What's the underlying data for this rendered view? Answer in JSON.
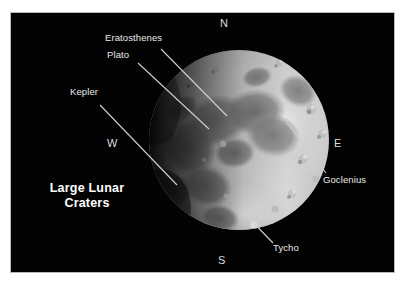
{
  "figure": {
    "title_line1": "Large Lunar",
    "title_line2": "Craters",
    "background_color": "#ffffff",
    "photo_background_color": "#000000",
    "frame_border_color": "#b9b9b9",
    "label_color": "#e9e9e9",
    "leader_line_color": "#d0d0d0"
  },
  "cardinals": [
    {
      "id": "north",
      "label": "N",
      "x": 219,
      "y": 16
    },
    {
      "id": "east",
      "label": "E",
      "x": 333,
      "y": 136
    },
    {
      "id": "south",
      "label": "S",
      "x": 217,
      "y": 254
    },
    {
      "id": "west",
      "label": "W",
      "x": 106,
      "y": 136
    }
  ],
  "craters": [
    {
      "id": "eratosthenes",
      "label": "Eratosthenes",
      "label_x": 104,
      "label_y": 36,
      "leader": {
        "x1": 160,
        "y1": 48,
        "x2": 226,
        "y2": 115
      }
    },
    {
      "id": "plato",
      "label": "Plato",
      "label_x": 106,
      "label_y": 54,
      "leader": {
        "x1": 137,
        "y1": 62,
        "x2": 208,
        "y2": 128
      }
    },
    {
      "id": "kepler",
      "label": "Kepler",
      "label_x": 69,
      "label_y": 90,
      "leader": {
        "x1": 99,
        "y1": 104,
        "x2": 176,
        "y2": 184
      }
    },
    {
      "id": "goclenius",
      "label": "Goclenius",
      "label_x": 322,
      "label_y": 177,
      "leader": {
        "x1": 286,
        "y1": 122,
        "x2": 325,
        "y2": 172
      }
    },
    {
      "id": "tycho",
      "label": "Tycho",
      "label_x": 272,
      "label_y": 244,
      "leader": {
        "x1": 243,
        "y1": 212,
        "x2": 272,
        "y2": 242
      }
    }
  ]
}
